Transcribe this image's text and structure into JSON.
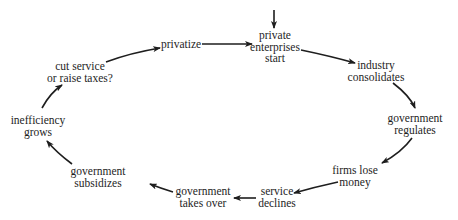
{
  "diagram": {
    "type": "cycle",
    "entry": {
      "label": "entry-arrow",
      "target": "private_enterprises_start"
    },
    "nodes": {
      "private_enterprises_start": {
        "lines": [
          "private",
          "enterprises",
          "start"
        ]
      },
      "industry_consolidates": {
        "lines": [
          "industry",
          "consolidates"
        ]
      },
      "government_regulates": {
        "lines": [
          "government",
          "regulates"
        ]
      },
      "firms_lose_money": {
        "lines": [
          "firms lose",
          "money"
        ]
      },
      "service_declines": {
        "lines": [
          "service",
          "declines"
        ]
      },
      "government_takes_over": {
        "lines": [
          "government",
          "takes over"
        ]
      },
      "government_subsidizes": {
        "lines": [
          "government",
          "subsidizes"
        ]
      },
      "inefficiency_grows": {
        "lines": [
          "inefficiency",
          "grows"
        ]
      },
      "cut_service_or_raise_taxes": {
        "lines": [
          "cut service",
          "or raise taxes?"
        ]
      },
      "privatize": {
        "lines": [
          "privatize"
        ]
      }
    },
    "sequence": [
      "private_enterprises_start",
      "industry_consolidates",
      "government_regulates",
      "firms_lose_money",
      "service_declines",
      "government_takes_over",
      "government_subsidizes",
      "inefficiency_grows",
      "cut_service_or_raise_taxes",
      "privatize",
      "private_enterprises_start"
    ],
    "colors": {
      "text": "#1e1e1e",
      "arrow": "#1e1e1e",
      "background": "#ffffff"
    }
  }
}
